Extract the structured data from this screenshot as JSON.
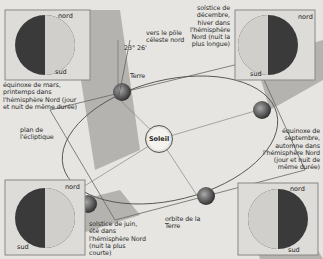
{
  "diagram": {
    "center": {
      "label": "Soleil"
    },
    "labels": {
      "pole": "vers le pôle céleste nord",
      "angle": "23° 26'",
      "terre": "Terre",
      "ecliptique": "plan de l'écliptique",
      "orbite": "orbite de la Terre"
    },
    "panels": [
      {
        "id": "mars",
        "caption": "équinoxe de mars, printemps dans l'hémisphère Nord (jour et nuit de même durée)",
        "nord": "nord",
        "sud": "sud"
      },
      {
        "id": "decembre",
        "caption": "solstice de décembre, hiver dans l'hémisphère Nord (nuit la plus longue)",
        "nord": "nord",
        "sud": "sud"
      },
      {
        "id": "septembre",
        "caption": "équinoxe de septembre, automne dans l'hémisphère Nord (jour et nuit de même durée)",
        "nord": "nord",
        "sud": "sud"
      },
      {
        "id": "juin",
        "caption": "solstice de juin, été dans l'hémisphère Nord (nuit la plus courte)",
        "nord": "nord",
        "sud": "sud"
      }
    ]
  },
  "colors": {
    "background": "#e6e5e1",
    "band": "#9e9d99",
    "globe_dark": "#3a3a3a",
    "globe_light": "#d9d8d4",
    "line": "#555555"
  }
}
